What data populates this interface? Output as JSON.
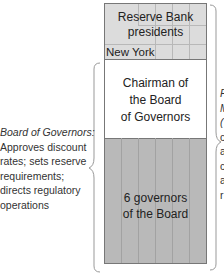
{
  "top_section": {
    "title_line1": "Reserve Bank",
    "title_line2": "presidents",
    "new_york": "New York"
  },
  "chairman": {
    "line1": "Chairman of",
    "line2": "the Board",
    "line3": "of Governors"
  },
  "governors": {
    "line1": "6 governors",
    "line2": "of the Board"
  },
  "left_annotation": {
    "title": "Board of Governors:",
    "lines": [
      "Approves discount",
      "rates; sets reserve",
      "requirements;",
      "directs regulatory",
      "operations"
    ]
  },
  "right_annotation": {
    "lines_truncated": [
      "F",
      "M",
      "(",
      "c",
      "a",
      "c",
      "a",
      "r"
    ]
  },
  "colors": {
    "reserve_bank_fill": "#dcdcdc",
    "chairman_fill": "#ffffff",
    "governors_fill": "#b9b9b9",
    "border": "#777777"
  }
}
